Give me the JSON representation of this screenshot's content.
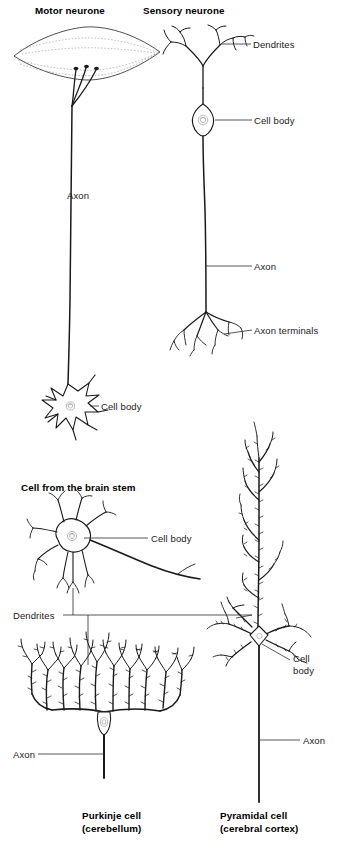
{
  "figure": {
    "background_color": "#ffffff",
    "ink_color": "#1a1a1a",
    "label_color": "#1a1a1a"
  },
  "panels": [
    {
      "id": "motor-neurone",
      "heading": "Motor neurone",
      "heading_position": "top",
      "labels": [
        {
          "name": "axon",
          "text": "Axon"
        },
        {
          "name": "cell-body",
          "text": "Cell body"
        }
      ],
      "parts": [
        "motor end plate",
        "axon",
        "cell body",
        "dendrites"
      ]
    },
    {
      "id": "sensory-neurone",
      "heading": "Sensory neurone",
      "heading_position": "top",
      "labels": [
        {
          "name": "dendrites",
          "text": "Dendrites"
        },
        {
          "name": "cell-body",
          "text": "Cell body"
        },
        {
          "name": "axon",
          "text": "Axon"
        },
        {
          "name": "axon-terminals",
          "text": "Axon terminals"
        }
      ],
      "parts": [
        "dendrites",
        "cell body",
        "axon",
        "axon terminals"
      ]
    },
    {
      "id": "brain-stem-cell",
      "heading": "Cell from the brain stem",
      "heading_position": "above",
      "labels": [
        {
          "name": "cell-body",
          "text": "Cell body"
        },
        {
          "name": "dendrites",
          "text": "Dendrites"
        }
      ],
      "parts": [
        "cell body",
        "dendrites",
        "axon"
      ]
    },
    {
      "id": "purkinje-cell",
      "heading": "Purkinje cell",
      "subheading": "(cerebellum)",
      "heading_position": "bottom",
      "labels": [
        {
          "name": "axon",
          "text": "Axon"
        },
        {
          "name": "dendrites",
          "text": "Dendrites"
        }
      ],
      "parts": [
        "dendritic tree",
        "cell body",
        "axon"
      ]
    },
    {
      "id": "pyramidal-cell",
      "heading": "Pyramidal cell",
      "subheading": "(cerebral cortex)",
      "heading_position": "bottom",
      "labels": [
        {
          "name": "cell-body",
          "text": "Cell\nbody"
        },
        {
          "name": "axon",
          "text": "Axon"
        },
        {
          "name": "dendrites",
          "text": "Dendrites"
        }
      ],
      "parts": [
        "apical dendrite",
        "basal dendrites",
        "cell body",
        "axon"
      ]
    }
  ],
  "headings": {
    "motor_neurone": "Motor neurone",
    "sensory_neurone": "Sensory neurone",
    "brain_stem_cell": "Cell from the brain stem",
    "purkinje_name": "Purkinje cell",
    "purkinje_sub": "(cerebellum)",
    "pyramidal_name": "Pyramidal cell",
    "pyramidal_sub": "(cerebral cortex)"
  },
  "callouts": {
    "motor_axon": "Axon",
    "motor_cell_body": "Cell body",
    "sensory_dendrites": "Dendrites",
    "sensory_cell_body": "Cell body",
    "sensory_axon": "Axon",
    "sensory_axon_terminals": "Axon terminals",
    "brainstem_cell_body": "Cell body",
    "shared_dendrites": "Dendrites",
    "purkinje_axon": "Axon",
    "pyramidal_cell_body_line1": "Cell",
    "pyramidal_cell_body_line2": "body",
    "pyramidal_axon": "Axon"
  }
}
